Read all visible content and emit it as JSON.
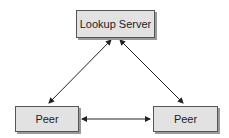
{
  "diagram": {
    "nodes": [
      {
        "id": "lookup-server",
        "label": "Lookup Server"
      },
      {
        "id": "peer-left",
        "label": "Peer"
      },
      {
        "id": "peer-right",
        "label": "Peer"
      }
    ],
    "edges": [
      {
        "from": "lookup-server",
        "to": "peer-left",
        "direction": "bidirectional"
      },
      {
        "from": "lookup-server",
        "to": "peer-right",
        "direction": "bidirectional"
      },
      {
        "from": "peer-left",
        "to": "peer-right",
        "direction": "bidirectional"
      }
    ],
    "colors": {
      "node_fill": "#e2e2e2",
      "node_border": "#555555",
      "shadow": "#9a9a9a",
      "edge": "#222222"
    }
  }
}
